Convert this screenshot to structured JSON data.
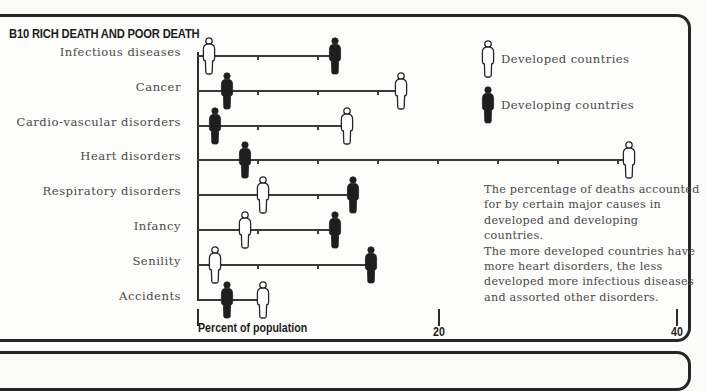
{
  "title": "B10 RICH DEATH AND POOR DEATH",
  "legend": {
    "developed": "Developed countries",
    "developing": "Developing countries"
  },
  "axis": {
    "label": "Percent of population",
    "tick_20": "20",
    "tick_40": "40"
  },
  "note": {
    "lines": [
      "The percentage of deaths accounted",
      "for by certain major causes in",
      "developed and developing",
      "countries.",
      "The more developed countries have",
      "more heart disorders, the less",
      "developed more infectious diseases",
      "and assorted other disorders."
    ]
  },
  "colors": {
    "developed_fill": "#ffffff",
    "developing_fill": "#1e1e1e",
    "stroke": "#262626"
  },
  "chart_data": {
    "type": "scatter",
    "title": "B10 RICH DEATH AND POOR DEATH",
    "xlabel": "Percent of population",
    "ylabel": "",
    "xlim": [
      0,
      40
    ],
    "x_ticks_labeled": [
      20,
      40
    ],
    "minor_tick_interval": 5,
    "legend_position": "top-right",
    "categories": [
      "Infectious diseases",
      "Cancer",
      "Cardio-vascular disorders",
      "Heart disorders",
      "Respiratory disorders",
      "Infancy",
      "Senility",
      "Accidents"
    ],
    "series": [
      {
        "name": "Developed countries",
        "marker": "outlined human figure",
        "values": [
          1,
          17,
          12.5,
          36,
          5.5,
          4,
          1.5,
          5.5
        ]
      },
      {
        "name": "Developing countries",
        "marker": "filled human figure",
        "values": [
          11.5,
          2.5,
          1.5,
          4,
          13,
          11.5,
          14.5,
          2.5
        ]
      }
    ],
    "annotations": [
      "The percentage of deaths accounted for by certain major causes in developed and developing countries.",
      "The more developed countries have more heart disorders, the less developed more infectious diseases and assorted other disorders."
    ]
  }
}
